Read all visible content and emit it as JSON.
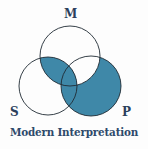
{
  "diagram": {
    "type": "venn",
    "caption": "Modern Interpretation",
    "labels": {
      "m": "M",
      "s": "S",
      "p": "P"
    },
    "shaded_regions": [
      "M∩S only",
      "M∩S∩P",
      "S∩P only",
      "P only"
    ],
    "unshaded_regions": [
      "M only",
      "S only",
      "M∩P only"
    ],
    "colors": {
      "shade": "#3f88a8",
      "stroke": "#1f2a33",
      "text": "#2e4a6b"
    }
  }
}
